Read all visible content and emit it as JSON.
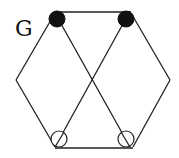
{
  "diagram": {
    "label": "G",
    "type": "graph",
    "vertices": [
      {
        "id": "top-left",
        "x": 57,
        "y": 19,
        "style": "filled"
      },
      {
        "id": "top-right",
        "x": 126,
        "y": 19,
        "style": "filled"
      },
      {
        "id": "left",
        "x": 16,
        "y": 80,
        "style": "none"
      },
      {
        "id": "right",
        "x": 170,
        "y": 80,
        "style": "none"
      },
      {
        "id": "bottom-left",
        "x": 59,
        "y": 139,
        "style": "open-slashed"
      },
      {
        "id": "bottom-right",
        "x": 126,
        "y": 139,
        "style": "open-slashed"
      }
    ],
    "edges": [
      [
        "top-left",
        "top-right"
      ],
      [
        "top-left",
        "left"
      ],
      [
        "left",
        "bottom-left"
      ],
      [
        "bottom-left",
        "bottom-right"
      ],
      [
        "bottom-right",
        "right"
      ],
      [
        "right",
        "top-right"
      ],
      [
        "top-left",
        "bottom-right"
      ],
      [
        "top-right",
        "bottom-left"
      ]
    ],
    "colors": {
      "stroke": "#222222",
      "filled_node": "#111111",
      "background": "#ffffff"
    }
  }
}
